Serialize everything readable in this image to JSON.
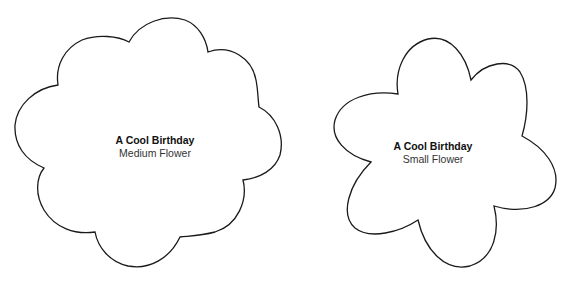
{
  "flowers": [
    {
      "title": "A Cool Birthday",
      "subtitle": "Medium Flower",
      "petals": 8
    },
    {
      "title": "A Cool Birthday",
      "subtitle": "Small Flower",
      "petals": 6
    }
  ],
  "colors": {
    "background": "#ffffff",
    "outline": "#1a1a1a",
    "text": "#111111"
  }
}
